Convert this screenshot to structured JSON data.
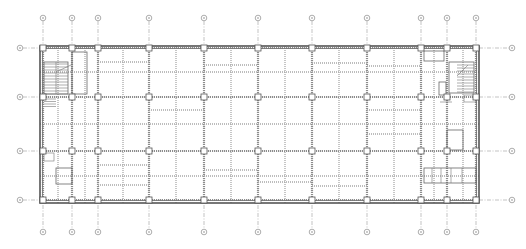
{
  "caption": {
    "text": "·· ·· ······ ·· ···· ······ ····· ····"
  },
  "drawing": {
    "type": "structural-floor-plan",
    "colors": {
      "axis": "#9a9a9a",
      "wall": "#555555",
      "beam": "#a8a8a8",
      "background": "#ffffff"
    },
    "column_axes_x": [
      43,
      72,
      98,
      149,
      204,
      258,
      312,
      367,
      421,
      447,
      476
    ],
    "top_bubbles_x": [
      43,
      72,
      98,
      149,
      204,
      258,
      312,
      367,
      421,
      447,
      476
    ],
    "bottom_bubbles_x": [
      43,
      72,
      98,
      149,
      204,
      258,
      312,
      367,
      421,
      447,
      476
    ],
    "row_axes_y": [
      48,
      97,
      151,
      200
    ],
    "left_bubbles_y": [
      48,
      97,
      151,
      200
    ],
    "right_bubbles_y": [
      48,
      97,
      151,
      200
    ],
    "top_bubble_y": 18,
    "bottom_bubble_y": 232,
    "left_bubble_x": 20,
    "right_bubble_x": 512,
    "outline": {
      "x1": 40,
      "y1": 46,
      "x2": 479,
      "y2": 203
    },
    "secondary_beams_x": [
      58,
      85,
      123,
      176,
      231,
      285,
      339,
      394,
      434,
      463
    ],
    "secondary_beams_y": [
      72,
      124,
      176
    ]
  }
}
